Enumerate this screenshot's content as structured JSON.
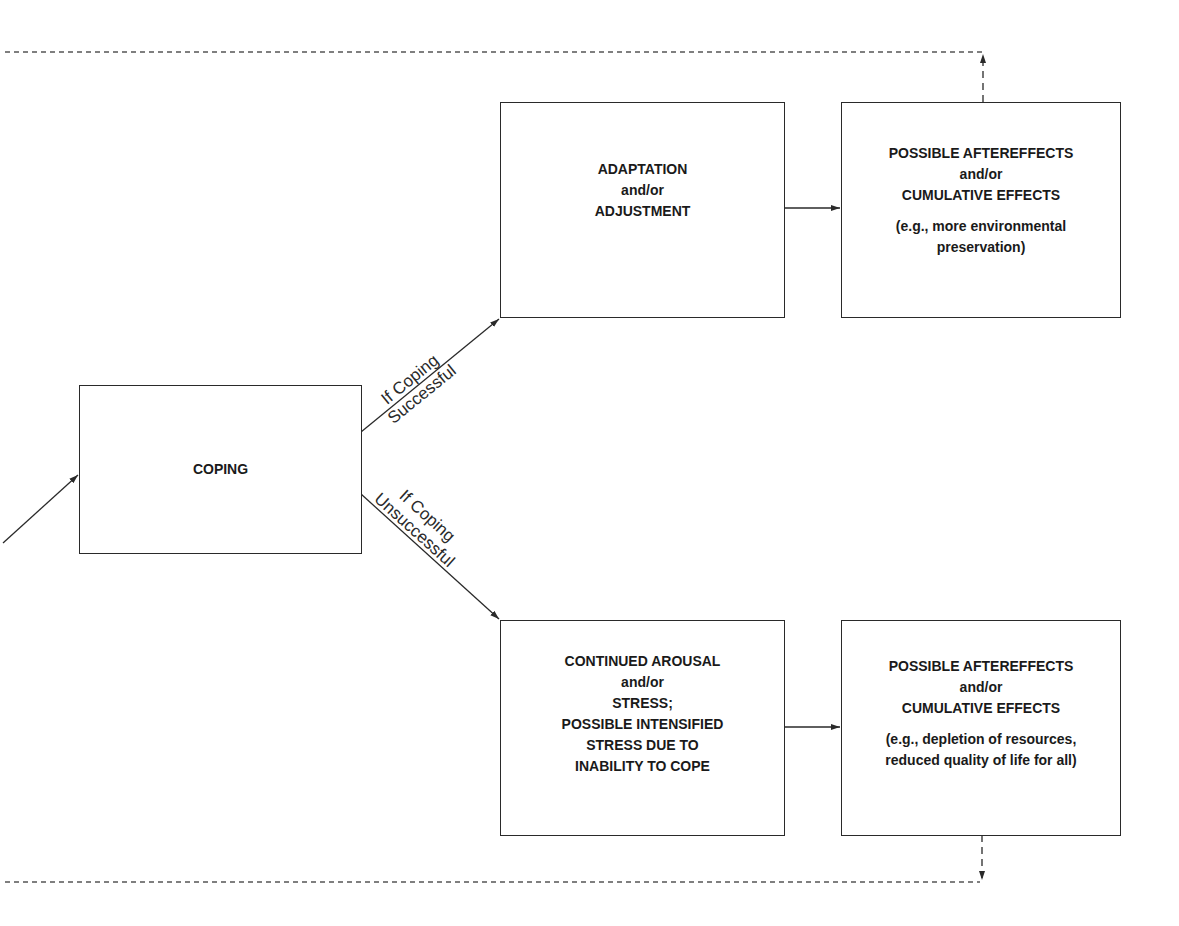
{
  "diagram": {
    "nodes": {
      "coping": {
        "lines": [
          "COPING"
        ]
      },
      "adaptation": {
        "lines": [
          "ADAPTATION",
          "and/or",
          "ADJUSTMENT"
        ]
      },
      "aftereffects_positive": {
        "lines": [
          "POSSIBLE AFTEREFFECTS",
          "and/or",
          "CUMULATIVE EFFECTS"
        ],
        "example_lines": [
          "(e.g., more environmental",
          "preservation)"
        ]
      },
      "continued_arousal": {
        "lines": [
          "CONTINUED AROUSAL",
          "and/or",
          "STRESS;",
          "POSSIBLE INTENSIFIED",
          "STRESS DUE TO",
          "INABILITY TO COPE"
        ]
      },
      "aftereffects_negative": {
        "lines": [
          "POSSIBLE AFTEREFFECTS",
          "and/or",
          "CUMULATIVE EFFECTS"
        ],
        "example_lines": [
          "(e.g., depletion of resources,",
          "reduced quality of life for all)"
        ]
      }
    },
    "edge_labels": {
      "success": [
        "If Coping",
        "Successful"
      ],
      "unsuccess": [
        "If Coping",
        "Unsuccessful"
      ]
    },
    "colors": {
      "stroke": "#2a2a2a",
      "background": "#ffffff",
      "text": "#1a1a1a"
    }
  }
}
